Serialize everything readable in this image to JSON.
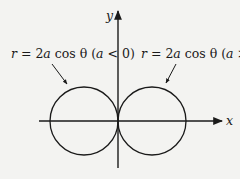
{
  "diagram": {
    "type": "polar-curve-plot",
    "axes": {
      "x_label": "x",
      "y_label": "y"
    },
    "curves": [
      {
        "name": "left-circle",
        "equation_prefix": "r = 2",
        "equation_var": "a",
        "equation_mid": " cos θ (",
        "cond_var": "a",
        "cond_rest": " < 0)",
        "label": "r = 2a cos θ (a < 0)"
      },
      {
        "name": "right-circle",
        "equation_prefix": "r = 2",
        "equation_var": "a",
        "equation_mid": " cos θ (",
        "cond_var": "a",
        "cond_rest": " > 0)",
        "label": "r = 2a cos θ (a > 0)"
      }
    ],
    "colors": {
      "background": "#f3f3f1",
      "stroke": "#1a1a1a"
    }
  }
}
